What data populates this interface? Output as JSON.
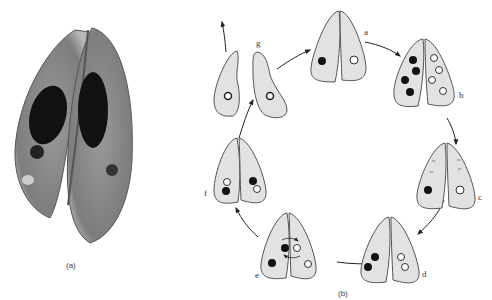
{
  "figure": {
    "panel_a": {
      "caption": "(a)",
      "description": "Micrograph of two conjugating paramecia"
    },
    "panel_b": {
      "caption": "(b)",
      "description": "Conjugation cycle diagram"
    },
    "stages": [
      {
        "id": "a",
        "label": "a"
      },
      {
        "id": "b",
        "label": "b"
      },
      {
        "id": "c",
        "label": "c"
      },
      {
        "id": "d",
        "label": "d"
      },
      {
        "id": "e",
        "label": "e"
      },
      {
        "id": "f",
        "label": "f"
      },
      {
        "id": "g",
        "label": "g"
      }
    ],
    "colors": {
      "cell_fill": "#e2e2e2",
      "cell_stroke": "#555555",
      "nucleus_dark": "#111111",
      "nucleus_light": "#ffffff"
    }
  }
}
